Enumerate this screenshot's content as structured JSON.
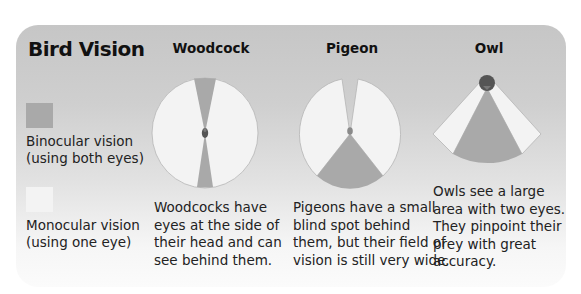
{
  "title": "Bird Vision",
  "colors": {
    "binocular": "#a9a9a9",
    "monocular": "#f3f3f3",
    "head": "#555555",
    "outline": "#9a9a9a"
  },
  "legend": [
    {
      "label_line1": "Binocular vision",
      "label_line2": "(using both eyes)",
      "color": "#a9a9a9"
    },
    {
      "label_line1": "Monocular vision",
      "label_line2": "(using one eye)",
      "color": "#f3f3f3"
    }
  ],
  "birds": [
    {
      "name": "Woodcock",
      "description": "Woodcocks have\neyes at the side of\ntheir head and can\nsee behind them."
    },
    {
      "name": "Pigeon",
      "description": "Pigeons have a small\nblind spot behind\nthem, but their field of\nvision is still very wide."
    },
    {
      "name": "Owl",
      "description": "Owls see a large\narea with two eyes.\nThey pinpoint their\nprey with great\naccuracy."
    }
  ]
}
